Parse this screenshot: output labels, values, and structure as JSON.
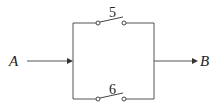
{
  "diagram": {
    "type": "parallel-switch-circuit",
    "input_node": {
      "label": "A"
    },
    "output_node": {
      "label": "B"
    },
    "switches": [
      {
        "label": "5",
        "branch": "top",
        "state": "open"
      },
      {
        "label": "6",
        "branch": "bottom",
        "state": "open"
      }
    ],
    "colors": {
      "wire": "#555555",
      "text": "#222222",
      "background": "#ffffff"
    }
  }
}
